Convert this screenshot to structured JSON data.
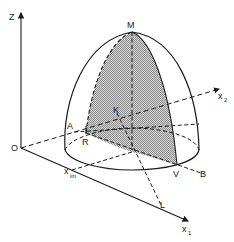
{
  "figure": {
    "type": "3D surface diagram",
    "colors": {
      "line": "#1a1a1a",
      "shade": "#bdbdbd",
      "background": "#ffffff"
    }
  },
  "axes": {
    "z": {
      "label": "Z"
    },
    "x1": {
      "label": "x",
      "sub": "1"
    },
    "x2": {
      "label": "x",
      "sub": "2"
    },
    "origin": {
      "label": "O"
    }
  },
  "points": {
    "M": "M",
    "K": "K",
    "A": "A",
    "R": "R",
    "V": "V",
    "B": "B",
    "L": "L",
    "xim": {
      "label": "x",
      "sub": "im"
    }
  }
}
